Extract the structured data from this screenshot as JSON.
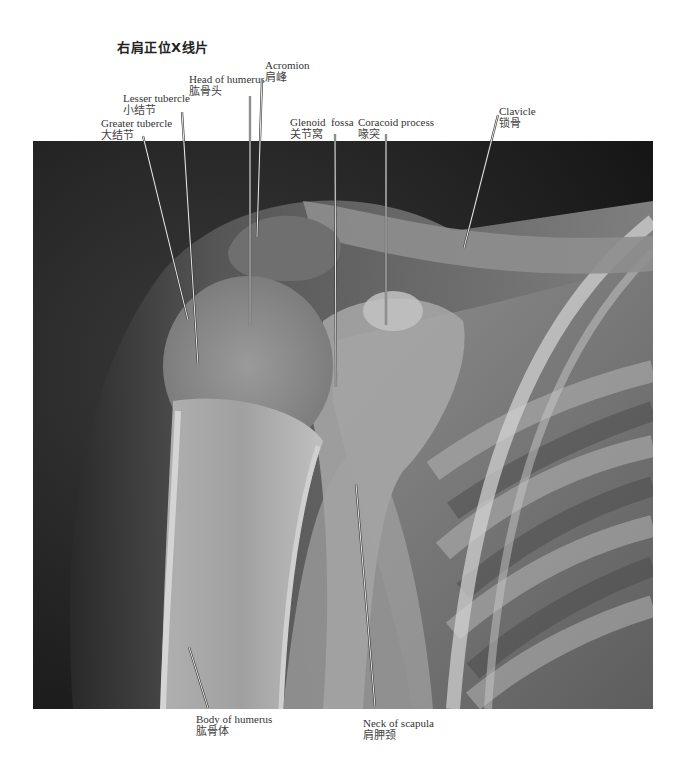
{
  "title": "右肩正位X线片",
  "xray": {
    "left": 33,
    "top": 141,
    "width": 620,
    "height": 568,
    "background": "#1a1a1a"
  },
  "labels": [
    {
      "id": "acromion",
      "en": "Acromion",
      "cn": "肩峰",
      "x": 265,
      "y": 59,
      "line": [
        [
          262,
          78
        ],
        [
          257,
          237
        ]
      ]
    },
    {
      "id": "head-of-humerus",
      "en": "Head of humerus",
      "cn": "肱骨头",
      "x": 189,
      "y": 73,
      "line": [
        [
          250,
          96
        ],
        [
          250,
          327
        ]
      ]
    },
    {
      "id": "lesser-tubercle",
      "en": "Lesser tubercle",
      "cn": "小结节",
      "x": 123,
      "y": 92,
      "line": [
        [
          182,
          112
        ],
        [
          198,
          365
        ]
      ]
    },
    {
      "id": "greater-tubercle",
      "en": "Greater tubercle",
      "cn": "大结节",
      "x": 101,
      "y": 117,
      "line": [
        [
          143,
          136
        ],
        [
          188,
          320
        ]
      ]
    },
    {
      "id": "glenoid-fossa",
      "en": "Glenoid  fossa",
      "cn": "关节窝",
      "x": 290,
      "y": 116,
      "line": [
        [
          335,
          134
        ],
        [
          336,
          387
        ]
      ]
    },
    {
      "id": "coracoid-process",
      "en": "Coracoid process",
      "cn": "喙突",
      "x": 358,
      "y": 116,
      "line": [
        [
          386,
          134
        ],
        [
          386,
          325
        ]
      ]
    },
    {
      "id": "clavicle",
      "en": "Clavicle",
      "cn": "锁骨",
      "x": 499,
      "y": 105,
      "line": [
        [
          498,
          115
        ],
        [
          464,
          248
        ]
      ]
    },
    {
      "id": "body-of-humerus",
      "en": "Body of humerus",
      "cn": "肱骨体",
      "x": 196,
      "y": 713,
      "line": [
        [
          208,
          708
        ],
        [
          189,
          647
        ]
      ]
    },
    {
      "id": "neck-of-scapula",
      "en": "Neck of scapula",
      "cn": "肩胛颈",
      "x": 363,
      "y": 717,
      "line": [
        [
          375,
          707
        ],
        [
          356,
          484
        ]
      ]
    }
  ]
}
